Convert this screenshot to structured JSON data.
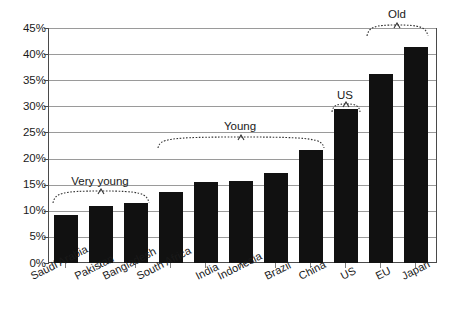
{
  "chart_data": {
    "type": "bar",
    "title": "",
    "subtitle": "",
    "xlabel": "",
    "ylabel": "",
    "ylim": [
      0,
      45
    ],
    "grid": true,
    "legend": "none",
    "bar_color": "#111111",
    "categories": [
      "Saudi Arabia",
      "Pakistan",
      "Bangladesh",
      "South Africa",
      "India",
      "Indonesia",
      "Brazil",
      "China",
      "US",
      "EU",
      "Japan"
    ],
    "values": [
      9.2,
      10.9,
      11.5,
      13.6,
      15.6,
      15.8,
      17.2,
      21.6,
      29.4,
      36.1,
      41.3
    ],
    "value_unit": "%",
    "ytick_labels": [
      "0%",
      "5%",
      "10%",
      "15%",
      "20%",
      "25%",
      "30%",
      "35%",
      "40%",
      "45%"
    ],
    "ytick_values": [
      0,
      5,
      10,
      15,
      20,
      25,
      30,
      35,
      40,
      45
    ],
    "annotations": [
      {
        "text": "Very young",
        "covers": [
          "Saudi Arabia",
          "Pakistan",
          "Bangladesh"
        ]
      },
      {
        "text": "Young",
        "covers": [
          "South Africa",
          "India",
          "Indonesia",
          "Brazil",
          "China"
        ]
      },
      {
        "text": "US",
        "covers": [
          "US"
        ]
      },
      {
        "text": "Old",
        "covers": [
          "EU",
          "Japan"
        ]
      }
    ]
  },
  "yticks": {
    "t0": "0%",
    "t1": "5%",
    "t2": "10%",
    "t3": "15%",
    "t4": "20%",
    "t5": "25%",
    "t6": "30%",
    "t7": "35%",
    "t8": "40%",
    "t9": "45%"
  },
  "xlabels": {
    "c0": "Saudi Arabia",
    "c1": "Pakistan",
    "c2": "Bangladesh",
    "c3": "South Africa",
    "c4": "India",
    "c5": "Indonesia",
    "c6": "Brazil",
    "c7": "China",
    "c8": "US",
    "c9": "EU",
    "c10": "Japan"
  },
  "annotations": {
    "a0": "Very young",
    "a1": "Young",
    "a2": "US",
    "a3": "Old"
  }
}
